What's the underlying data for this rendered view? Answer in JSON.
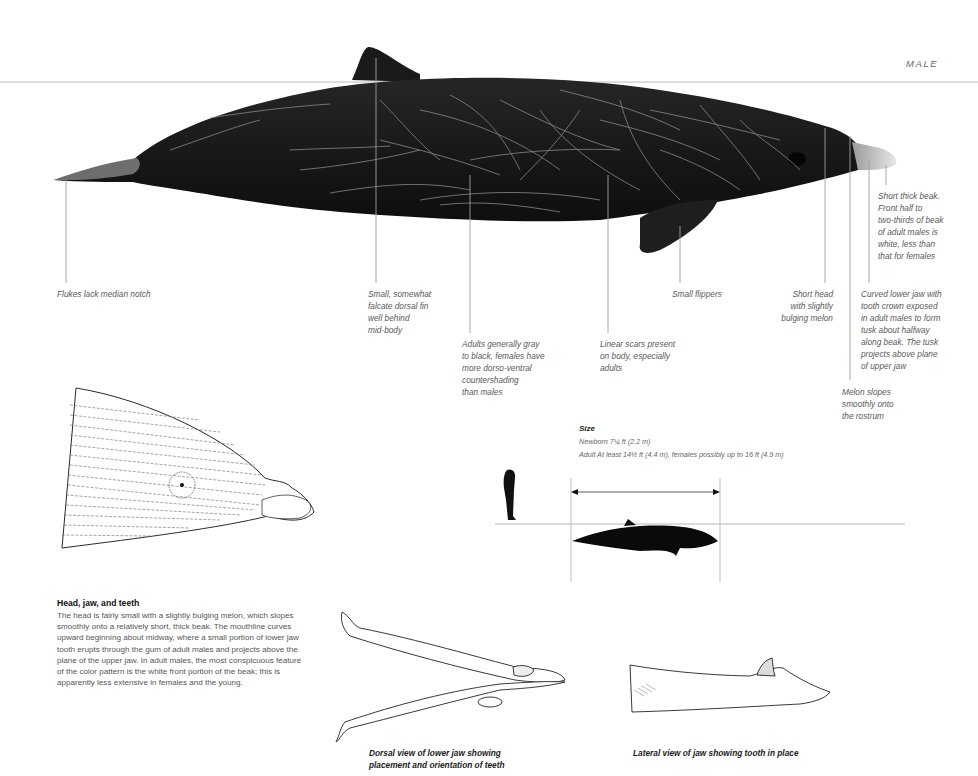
{
  "header": {
    "sex_label": "MALE"
  },
  "main_illustration": {
    "subject": "male beaked whale, lateral view",
    "annotations": [
      {
        "id": "flukes",
        "lines": [
          "Flukes lack median notch"
        ]
      },
      {
        "id": "dorsal-fin",
        "lines": [
          "Small, somewhat",
          "falcate dorsal fin",
          "well behind",
          "mid-body"
        ]
      },
      {
        "id": "coloration",
        "lines": [
          "Adults generally gray",
          "to black, females have",
          "more dorso-ventral",
          "countershading",
          "than males"
        ]
      },
      {
        "id": "scars",
        "lines": [
          "Linear scars present",
          "on body, especially",
          "adults"
        ]
      },
      {
        "id": "flippers",
        "lines": [
          "Small flippers"
        ]
      },
      {
        "id": "head",
        "lines": [
          "Short head",
          "with slightly",
          "bulging melon"
        ]
      },
      {
        "id": "melon",
        "lines": [
          "Melon slopes",
          "smoothly onto",
          "the rostrum"
        ]
      },
      {
        "id": "lower-jaw",
        "lines": [
          "Curved lower jaw with",
          "tooth crown exposed",
          "in adult males to form",
          "tusk about halfway",
          "along beak. The tusk",
          "projects above plane",
          "of upper jaw"
        ]
      },
      {
        "id": "beak",
        "lines": [
          "Short thick beak.",
          "Front half to",
          "two-thirds of beak",
          "of adult males is",
          "white, less than",
          "that for females"
        ]
      }
    ]
  },
  "size": {
    "title": "Size",
    "newborn": "Newborn  7¼ ft (2.2 m)",
    "adult": "Adult  At least 14½ ft (4.4 m), females possibly up to 16 ft (4.9 m)"
  },
  "head_section": {
    "title": "Head, jaw, and teeth",
    "lines": [
      "The head is fairly small with a slightly bulging melon, which slopes",
      "smoothly onto a relatively short, thick beak. The mouthline curves",
      "upward beginning about midway, where a small portion of lower jaw",
      "tooth erupts through the gum of adult males and projects above the",
      "plane of the upper jaw. In adult males, the most conspicuous feature",
      "of the color pattern is the white front portion of the beak; this is",
      "apparently less extensive in females and the young."
    ]
  },
  "captions": {
    "dorsal_jaw": [
      "Dorsal view of lower jaw showing",
      "placement and orientation of teeth"
    ],
    "lateral_jaw": "Lateral view of jaw showing tooth in place"
  },
  "colors": {
    "whale_body": "#1c1c1c",
    "scar": "#8a8a8a",
    "leader_line": "#9a9a9a",
    "waterline": "#cfcfcf",
    "text": "#5a5a5a"
  }
}
